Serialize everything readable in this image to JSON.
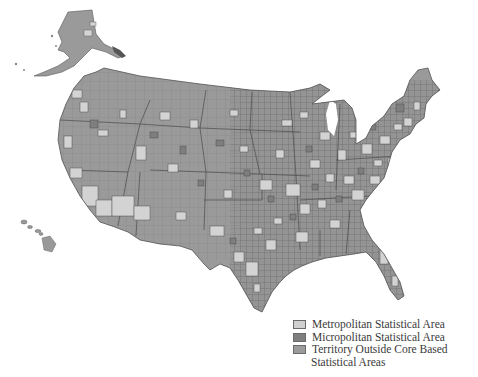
{
  "map": {
    "title": "",
    "region": "United States",
    "colors": {
      "metropolitan": "#d2d2d2",
      "micropolitan": "#7e7e7e",
      "outside": "#9a9a9a",
      "border": "#4a4a4a",
      "background": "#ffffff"
    }
  },
  "legend": {
    "items": [
      {
        "label": "Metropolitan Statistical Area",
        "color": "#d0d0d0"
      },
      {
        "label": "Micropolitan Statistical Area",
        "color": "#7f7f7f"
      },
      {
        "label": "Territory Outside Core Based",
        "color": "#9b9b9b"
      }
    ],
    "continuation": "Statistical Areas"
  }
}
